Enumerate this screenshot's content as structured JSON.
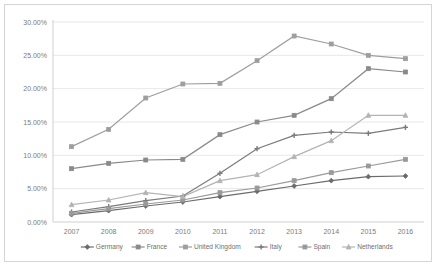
{
  "chart_data": {
    "type": "line",
    "title": "",
    "subtitle": "",
    "xlabel": "",
    "ylabel": "",
    "categories": [
      "2007",
      "2008",
      "2009",
      "2010",
      "2011",
      "2012",
      "2013",
      "2014",
      "2015",
      "2016"
    ],
    "x": [
      2007,
      2008,
      2009,
      2010,
      2011,
      2012,
      2013,
      2014,
      2015,
      2016
    ],
    "ylim": [
      0,
      30
    ],
    "yticks": [
      0,
      5,
      10,
      15,
      20,
      25,
      30
    ],
    "ytick_labels": [
      "0.00%",
      "5.00%",
      "10.00%",
      "15.00%",
      "20.00%",
      "25.00%",
      "30.00%"
    ],
    "grid": true,
    "legend_position": "bottom",
    "value_format": "percent",
    "series": [
      {
        "name": "Germany",
        "color": "#6b6b6b",
        "marker": "diamond",
        "values": [
          1.1,
          1.7,
          2.4,
          3.0,
          3.8,
          4.6,
          5.4,
          6.2,
          6.8,
          6.9
        ]
      },
      {
        "name": "France",
        "color": "#8a8a8a",
        "marker": "square",
        "values": [
          8.0,
          8.8,
          9.3,
          9.4,
          13.1,
          15.0,
          16.0,
          18.5,
          23.0,
          22.5
        ]
      },
      {
        "name": "United Kingdom",
        "color": "#9e9e9e",
        "marker": "square",
        "values": [
          11.3,
          13.9,
          18.6,
          20.7,
          20.8,
          24.2,
          27.9,
          26.7,
          25.0,
          24.5
        ]
      },
      {
        "name": "Italy",
        "color": "#7a7a7a",
        "marker": "cross",
        "values": [
          1.5,
          2.3,
          3.2,
          3.9,
          7.3,
          11.0,
          13.0,
          13.5,
          13.3,
          14.2
        ]
      },
      {
        "name": "Spain",
        "color": "#9a9a9a",
        "marker": "square",
        "values": [
          1.3,
          2.0,
          2.7,
          3.3,
          4.4,
          5.1,
          6.2,
          7.4,
          8.4,
          9.4
        ]
      },
      {
        "name": "Netherlands",
        "color": "#b4b4b4",
        "marker": "triangle",
        "values": [
          2.6,
          3.3,
          4.4,
          3.8,
          6.2,
          7.1,
          9.8,
          12.2,
          16.0,
          16.0
        ]
      }
    ]
  },
  "legend": {
    "items": [
      "Germany",
      "France",
      "United Kingdom",
      "Italy",
      "Spain",
      "Netherlands"
    ]
  },
  "colors": {
    "background": "#ffffff",
    "grid": "#e8e8e8",
    "axis": "#cfcfcf",
    "tick_label": "#7b7b7b",
    "legend_label": "#6f6f6f",
    "frame_border": "#d5d5d5"
  }
}
